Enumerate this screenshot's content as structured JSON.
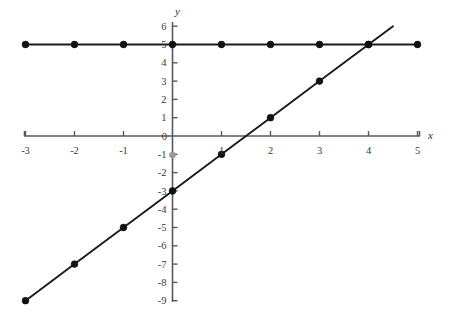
{
  "chart_data": {
    "type": "line",
    "title": "",
    "xlabel": "x",
    "ylabel": "y",
    "xlim": [
      -3.4,
      5.4
    ],
    "ylim": [
      -9.6,
      6.4
    ],
    "grid": false,
    "legend": "none",
    "x_ticks": [
      -3,
      -2,
      -1,
      1,
      2,
      3,
      4,
      5
    ],
    "y_ticks": [
      6,
      5,
      4,
      3,
      2,
      1,
      -1,
      -2,
      -3,
      -4,
      -5,
      -6,
      -7,
      -8,
      -9
    ],
    "origin_label": "0",
    "x_tick_labels": [
      "-3",
      "-2",
      "-1",
      "1",
      "2",
      "3",
      "4",
      "5"
    ],
    "y_tick_labels": [
      "6",
      "5",
      "4",
      "3",
      "2",
      "1",
      "-1",
      "-2",
      "-3",
      "-4",
      "-5",
      "-6",
      "-7",
      "-8",
      "-9"
    ],
    "series": [
      {
        "name": "y = 5",
        "equation": "y = 5",
        "style": "solid-with-markers",
        "color": "#111111",
        "x": [
          -3,
          -2,
          -1,
          0,
          1,
          2,
          3,
          4,
          5
        ],
        "values": [
          5,
          5,
          5,
          5,
          5,
          5,
          5,
          5,
          5
        ]
      },
      {
        "name": "y = 2x - 3",
        "equation": "y = 2x - 3",
        "style": "solid-with-markers",
        "color": "#111111",
        "x": [
          -3,
          -2,
          -1,
          0,
          1,
          2,
          3,
          4
        ],
        "values": [
          -9,
          -7,
          -5,
          -3,
          -1,
          1,
          3,
          5
        ],
        "extends_to": [
          4.5,
          6
        ]
      }
    ],
    "intersection": {
      "x": 4,
      "y": 5
    }
  },
  "axes": {
    "x_name": "x",
    "y_name": "y"
  }
}
